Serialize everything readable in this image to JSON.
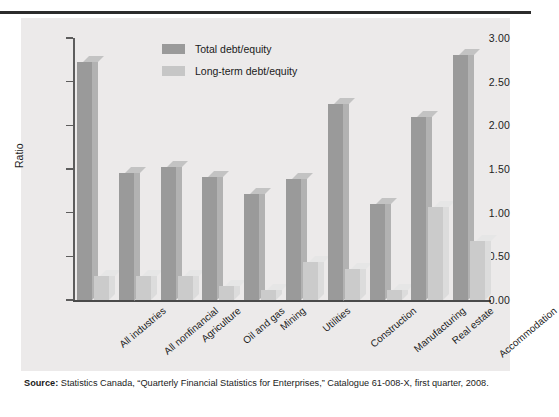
{
  "figure": {
    "source_label": "Source:",
    "source_text": " Statistics Canada, “Quarterly Financial Statistics for Enterprises,” Catalogue 61-008-X, first quarter, 2008."
  },
  "colors": {
    "total_debt_equity": "#9a9a9a",
    "long_term_debt_equity": "#cbcbcb",
    "panel_background": "#eceaea",
    "axis": "#4a4a4a",
    "text": "#1a1a1a"
  },
  "chart_data": {
    "type": "bar",
    "title": "",
    "xlabel": "",
    "ylabel": "Ratio",
    "ylim": [
      0.0,
      3.0
    ],
    "yticks": [
      0.0,
      0.5,
      1.0,
      1.5,
      2.0,
      2.5,
      3.0
    ],
    "ytick_labels": [
      "0.00",
      "0.50",
      "1.00",
      "1.50",
      "2.00",
      "2.50",
      "3.00"
    ],
    "grid": false,
    "legend_position": "top-left-inside",
    "categories": [
      "All industries",
      "All nonfinancial",
      "Agriculture",
      "Oil and gas",
      "Mining",
      "Utilities",
      "Construction",
      "Manufacturing",
      "Real estate",
      "Accommodation"
    ],
    "series": [
      {
        "name": "Total debt/equity",
        "color": "#9a9a9a",
        "values": [
          2.72,
          1.46,
          1.52,
          1.41,
          1.21,
          1.38,
          2.25,
          1.1,
          2.1,
          2.81
        ]
      },
      {
        "name": "Long-term debt/equity",
        "color": "#cbcbcb",
        "values": [
          0.28,
          0.28,
          0.28,
          0.16,
          0.12,
          0.43,
          0.36,
          0.11,
          1.07,
          0.68
        ]
      }
    ]
  }
}
